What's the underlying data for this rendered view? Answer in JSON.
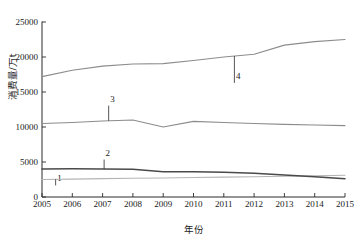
{
  "chart_data": {
    "type": "line",
    "title": "",
    "xlabel": "年份",
    "ylabel": "消费量/万t",
    "x": [
      2005,
      2006,
      2007,
      2008,
      2009,
      2010,
      2011,
      2012,
      2013,
      2014,
      2015
    ],
    "xticklabels": [
      "2005",
      "2006",
      "2007",
      "2008",
      "2009",
      "2010",
      "2011",
      "2012",
      "2013",
      "2014",
      "2015"
    ],
    "yticklabels": [
      "0",
      "5000",
      "10000",
      "15000",
      "20000",
      "25000"
    ],
    "ytickvalues": [
      0,
      5000,
      10000,
      15000,
      20000,
      25000
    ],
    "ylim": [
      0,
      25000
    ],
    "xlim": [
      2005,
      2015
    ],
    "grid": false,
    "legend_position": "inline-callout",
    "series": [
      {
        "name": "1",
        "label": "1",
        "color": "#b5b5b5",
        "values": [
          2500,
          2560,
          2620,
          2680,
          2720,
          2780,
          2840,
          2900,
          2960,
          3020,
          3100
        ]
      },
      {
        "name": "2",
        "label": "2",
        "color": "#4a4a4a",
        "values": [
          4000,
          4020,
          4010,
          3950,
          3620,
          3600,
          3520,
          3380,
          3150,
          2880,
          2620
        ]
      },
      {
        "name": "3",
        "label": "3",
        "color": "#8c8c8c",
        "values": [
          10500,
          10650,
          10850,
          11000,
          10000,
          10800,
          10650,
          10500,
          10380,
          10280,
          10200
        ]
      },
      {
        "name": "4",
        "label": "4",
        "color": "#8c8c8c",
        "values": [
          17200,
          18100,
          18700,
          19000,
          19050,
          19500,
          20000,
          20400,
          21700,
          22200,
          22500
        ]
      }
    ],
    "annotations": [
      {
        "label": "1",
        "series": "1",
        "x": 2005.45,
        "y": 1650
      },
      {
        "label": "2",
        "series": "2",
        "x": 2007.05,
        "y": 5350
      },
      {
        "label": "3",
        "series": "3",
        "x": 2007.2,
        "y": 13050
      },
      {
        "label": "4",
        "series": "4",
        "x": 2011.35,
        "y": 16300
      }
    ]
  }
}
